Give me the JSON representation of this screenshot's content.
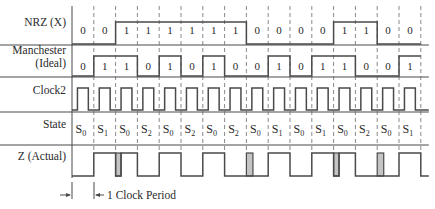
{
  "diagram": {
    "title": "",
    "rows": [
      {
        "key": "nrz",
        "label_lines": [
          "NRZ (X)"
        ],
        "type": "level_bits"
      },
      {
        "key": "manchester",
        "label_lines": [
          "Manchester",
          "(Ideal)"
        ],
        "type": "level_bits"
      },
      {
        "key": "clock2",
        "label_lines": [
          "Clock2"
        ],
        "type": "clock"
      },
      {
        "key": "state",
        "label_lines": [
          "State"
        ],
        "type": "text"
      },
      {
        "key": "z",
        "label_lines": [
          "Z (Actual)"
        ],
        "type": "pulses"
      }
    ],
    "nrz_bits": [
      0,
      0,
      1,
      1,
      1,
      1,
      1,
      1,
      0,
      0,
      0,
      0,
      1,
      1,
      0,
      0
    ],
    "manchester_bits": [
      0,
      1,
      1,
      0,
      1,
      0,
      1,
      0,
      0,
      1,
      0,
      1,
      1,
      0,
      0,
      1
    ],
    "clock2_pulses_per_column": 1,
    "states": [
      "S0",
      "S1",
      "S0",
      "S2",
      "S0",
      "S2",
      "S0",
      "S2",
      "S0",
      "S1",
      "S0",
      "S1",
      "S0",
      "S2",
      "S0",
      "S1"
    ],
    "z_segments": [
      {
        "col": 1,
        "start": 0.0,
        "end": 1.0,
        "glitch": false
      },
      {
        "col": 2,
        "start": 0.0,
        "end": 0.25,
        "glitch": true
      },
      {
        "col": 2,
        "start": 0.25,
        "end": 1.0,
        "glitch": false
      },
      {
        "col": 4,
        "start": 0.0,
        "end": 1.0,
        "glitch": false
      },
      {
        "col": 6,
        "start": 0.0,
        "end": 1.0,
        "glitch": false
      },
      {
        "col": 8,
        "start": 0.0,
        "end": 0.3,
        "glitch": true
      },
      {
        "col": 9,
        "start": 0.0,
        "end": 1.0,
        "glitch": false
      },
      {
        "col": 11,
        "start": 0.0,
        "end": 1.0,
        "glitch": false
      },
      {
        "col": 12,
        "start": 0.0,
        "end": 0.25,
        "glitch": true
      },
      {
        "col": 12,
        "start": 0.25,
        "end": 1.0,
        "glitch": false
      },
      {
        "col": 14,
        "start": 0.0,
        "end": 0.3,
        "glitch": true
      },
      {
        "col": 15,
        "start": 0.0,
        "end": 1.0,
        "glitch": false
      }
    ],
    "period_marker_label": "1 Clock Period",
    "colors": {
      "line": "#4a4a4a",
      "dash": "#6a6a6a",
      "glitch_fill": "#c4c4c4",
      "text": "#2a2a2a"
    }
  }
}
